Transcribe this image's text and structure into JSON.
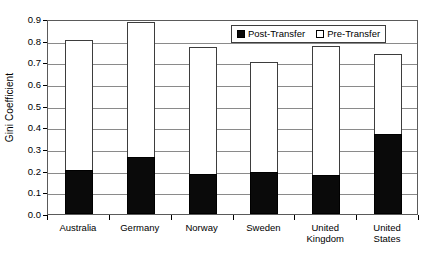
{
  "chart_data": {
    "type": "bar",
    "title": "",
    "xlabel": "",
    "ylabel": "Gini Coefficient",
    "ylim": [
      0.0,
      0.9
    ],
    "ytick_step": 0.1,
    "grid": true,
    "legend_position": "top-right",
    "stacked": false,
    "categories": [
      "Australia",
      "Germany",
      "Norway",
      "Sweden",
      "United\nKingdom",
      "United\nStates"
    ],
    "yticks": [
      "0.0",
      "0.1",
      "0.2",
      "0.3",
      "0.4",
      "0.5",
      "0.6",
      "0.7",
      "0.8",
      "0.9"
    ],
    "ytick_values": [
      0.0,
      0.1,
      0.2,
      0.3,
      0.4,
      0.5,
      0.6,
      0.7,
      0.8,
      0.9
    ],
    "series": [
      {
        "name": "Post-Transfer",
        "swatch": "filled",
        "color": "#0a0a0a",
        "values": [
          0.205,
          0.265,
          0.185,
          0.195,
          0.18,
          0.37
        ]
      },
      {
        "name": "Pre-Transfer",
        "swatch": "hollow",
        "color": "#ffffff",
        "values": [
          0.805,
          0.885,
          0.77,
          0.7,
          0.775,
          0.74
        ]
      }
    ]
  },
  "legend": {
    "items": [
      {
        "label": "Post-Transfer",
        "swatch": "filled"
      },
      {
        "label": "Pre-Transfer",
        "swatch": "hollow"
      }
    ]
  },
  "axis": {
    "y_title": "Gini Coefficient"
  }
}
